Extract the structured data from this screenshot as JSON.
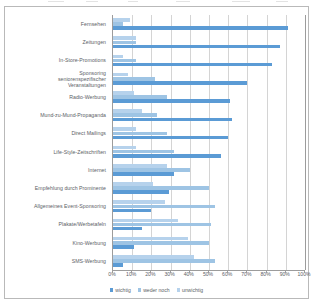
{
  "chart_data": {
    "type": "bar",
    "orientation": "horizontal",
    "title": "",
    "subtitle": "",
    "xlabel": "",
    "ylabel": "",
    "xlim": [
      0,
      100
    ],
    "xticks": [
      "0%",
      "10%",
      "20%",
      "30%",
      "40%",
      "50%",
      "60%",
      "70%",
      "80%",
      "90%",
      "100%"
    ],
    "grid": true,
    "legend_position": "bottom",
    "value_suffix": "%",
    "categories": [
      "Fernsehen",
      "Zeitungen",
      "In-Store-Promotions",
      "Sponsoring\nseniorenspezifischer\nVeranstaltungen",
      "Radio-Werbung",
      "Mund-zu-Mund-Propaganda",
      "Direct Mailings",
      "Life-Style-Zeitschriften",
      "Internet",
      "Empfehlung durch Prominente",
      "Allgemeines Event-Sponsoring",
      "Plakate/Werbetafeln",
      "Kino-Werbung",
      "SMS-Werbung"
    ],
    "series": [
      {
        "name": "wichtig",
        "color": "#5b9bd5",
        "values": [
          91,
          87,
          83,
          70,
          61,
          62,
          60,
          56,
          32,
          29,
          20,
          15,
          11,
          5
        ]
      },
      {
        "name": "weder noch",
        "color": "#9ec4e4",
        "values": [
          5,
          12,
          12,
          22,
          28,
          23,
          28,
          32,
          40,
          50,
          53,
          51,
          50,
          53
        ]
      },
      {
        "name": "unwichtig",
        "color": "#b6d2ec",
        "values": [
          9,
          12,
          5,
          8,
          11,
          15,
          12,
          12,
          28,
          21,
          27,
          34,
          39,
          42
        ]
      }
    ]
  },
  "legend": {
    "items": [
      {
        "label": "wichtig"
      },
      {
        "label": "weder noch"
      },
      {
        "label": "unwichtig"
      }
    ]
  },
  "colors": {
    "wichtig": "#5b9bd5",
    "weder_noch": "#9ec4e4",
    "unwichtig": "#b6d2ec",
    "grid": "#d4d4d4",
    "axis": "#9c9c9c",
    "text": "#5b6166",
    "frame": "#b9b9b9",
    "background": "#ffffff"
  }
}
